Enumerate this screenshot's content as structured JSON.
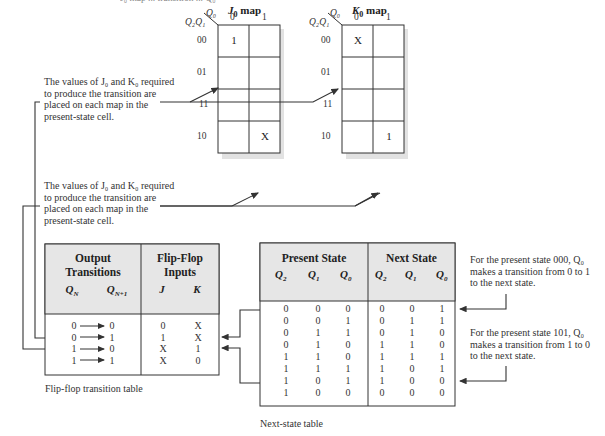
{
  "top_caption_cut": "J₀ map ... transition ... Q₀",
  "j_map": {
    "title": "J",
    "title_sub": "0",
    "title_suffix": " map",
    "col_var": "Q₀",
    "row_var": "Q₂Q₁",
    "col_labels": [
      "0",
      "1"
    ],
    "row_labels": [
      "00",
      "01",
      "11",
      "10"
    ],
    "cells": [
      [
        "1",
        ""
      ],
      [
        "",
        ""
      ],
      [
        "",
        ""
      ],
      [
        "",
        "X"
      ]
    ]
  },
  "k_map": {
    "title": "K",
    "title_sub": "0",
    "title_suffix": " map",
    "col_var": "Q₀",
    "row_var": "Q₂Q₁",
    "col_labels": [
      "0",
      "1"
    ],
    "row_labels": [
      "00",
      "01",
      "11",
      "10"
    ],
    "cells": [
      [
        "X",
        ""
      ],
      [
        "",
        ""
      ],
      [
        "",
        ""
      ],
      [
        "",
        "1"
      ]
    ]
  },
  "notes": {
    "map_note_1": [
      "The values of J₀ and K₀ required",
      "to produce the transition are",
      "placed on each map in the",
      "present-state cell."
    ],
    "map_note_2": [
      "The values of J₀ and K₀ required",
      "to produce the transition are",
      "placed on each map in the",
      "present-state cell."
    ],
    "state_note_1": [
      "For the present state 000, Q₀",
      "makes a transition from 0 to 1",
      "to the next state."
    ],
    "state_note_2": [
      "For the present state 101, Q₀",
      "makes a transition from 1 to 0",
      "to the next state."
    ]
  },
  "transition_table": {
    "header_left_1": "Output",
    "header_left_2": "Transitions",
    "header_right_1": "Flip-Flop",
    "header_right_2": "Inputs",
    "col_qn": "Q",
    "col_qn_sub": "N",
    "col_qn1": "Q",
    "col_qn1_sub": "N+1",
    "col_j": "J",
    "col_k": "K",
    "rows": [
      {
        "qn": "0",
        "qn1": "0",
        "j": "0",
        "k": "X"
      },
      {
        "qn": "0",
        "qn1": "1",
        "j": "1",
        "k": "X"
      },
      {
        "qn": "1",
        "qn1": "0",
        "j": "X",
        "k": "1"
      },
      {
        "qn": "1",
        "qn1": "1",
        "j": "X",
        "k": "0"
      }
    ],
    "caption": "Flip-flop transition table"
  },
  "next_state_table": {
    "header_present": "Present State",
    "header_next": "Next State",
    "cols": [
      "Q",
      "Q",
      "Q",
      "Q",
      "Q",
      "Q"
    ],
    "col_subs": [
      "2",
      "1",
      "0",
      "2",
      "1",
      "0"
    ],
    "rows": [
      [
        "0",
        "0",
        "0",
        "0",
        "0",
        "1"
      ],
      [
        "0",
        "0",
        "1",
        "0",
        "1",
        "1"
      ],
      [
        "0",
        "1",
        "1",
        "0",
        "1",
        "0"
      ],
      [
        "0",
        "1",
        "0",
        "1",
        "1",
        "0"
      ],
      [
        "1",
        "1",
        "0",
        "1",
        "1",
        "1"
      ],
      [
        "1",
        "1",
        "1",
        "1",
        "0",
        "1"
      ],
      [
        "1",
        "0",
        "1",
        "1",
        "0",
        "0"
      ],
      [
        "1",
        "0",
        "0",
        "0",
        "0",
        "0"
      ]
    ],
    "caption": "Next-state table"
  },
  "colors": {
    "header_fill": "#e6e6e6",
    "line": "#333333",
    "shadow": "#dcdcdc"
  }
}
